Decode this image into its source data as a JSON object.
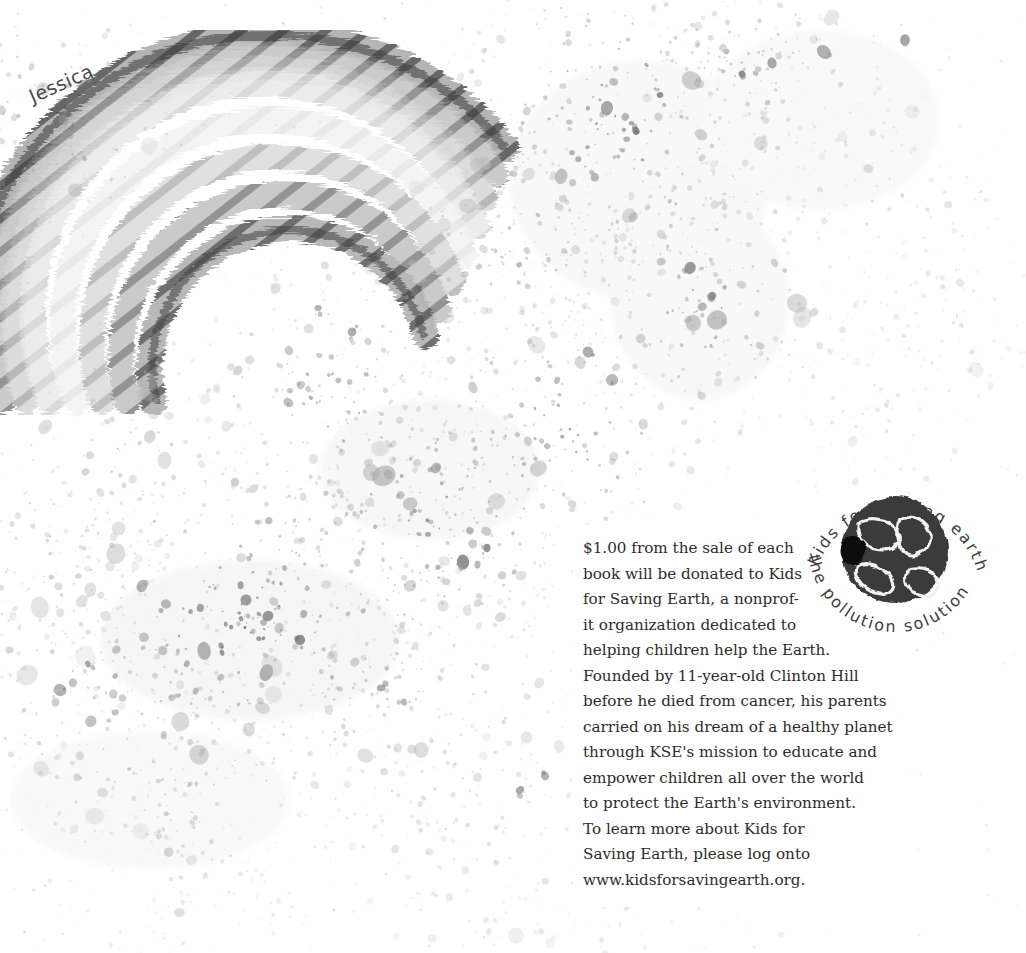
{
  "page": {
    "background_color": "#ffffff",
    "width": 1026,
    "height": 953,
    "ink_color": "#555555"
  },
  "artwork": {
    "name": "rainbow-arc-painting",
    "signature": "Jessica",
    "description": "hand-painted arched rainbow in grayscale brush strokes with paint splatter",
    "band_colors": [
      "#4a4a4a",
      "#6f6f6f",
      "#9a9a9a",
      "#c8c8c8",
      "#e6e6e6",
      "#b4b4b4",
      "#7d7d7d",
      "#555555"
    ]
  },
  "donation": {
    "lines": [
      "$1.00 from the sale of each",
      "book will be donated to Kids",
      "for Saving Earth, a nonprof-",
      "it organization dedicated to",
      "helping children help the Earth.",
      "Founded by 11-year-old Clinton Hill",
      "before he died from cancer, his parents",
      "carried on his dream of a healthy planet",
      "through KSE's mission to educate and",
      "empower children all over the world",
      "to protect the Earth's environment.",
      "To learn more about Kids for",
      "Saving Earth, please log onto",
      "www.kidsforsavingearth.org."
    ]
  },
  "logo": {
    "name": "kids-for-saving-earth-logo",
    "top_arc_text": "Kids for SAVing earth",
    "bottom_arc_text": "the pollution solution",
    "globe_fill": "#3b3b3b",
    "globe_outline": "#f2f2f2"
  }
}
